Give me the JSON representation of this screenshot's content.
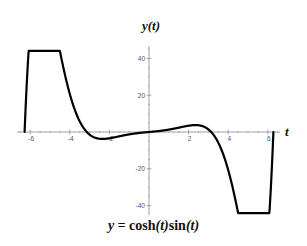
{
  "chart_data": {
    "type": "line",
    "title": "",
    "function": "y = cosh(t)sin(t)",
    "caption": "y = cosh(t)sin(t)",
    "xlabel": "t",
    "ylabel": "y(t)",
    "xlim": [
      -6.283,
      6.283
    ],
    "ylim": [
      -45,
      45
    ],
    "x_ticks": [
      -6,
      -4,
      -2,
      2,
      4,
      6
    ],
    "y_ticks": [
      -40,
      -20,
      20,
      40
    ],
    "x_tick_labels": [
      "-6",
      "-4",
      "-2",
      "2",
      "4",
      "6"
    ],
    "y_tick_labels": [
      "-40",
      "-20",
      "20",
      "40"
    ],
    "grid": false,
    "legend": null,
    "series": [
      {
        "name": "cosh(t)sin(t)",
        "x": [
          -6.283,
          -6.0,
          -5.5,
          -5.0,
          -4.5,
          -4.0,
          -3.5,
          -3.0,
          -2.5,
          -2.0,
          -1.5,
          -1.0,
          -0.5,
          0,
          0.5,
          1.0,
          1.5,
          2.0,
          2.5,
          3.0,
          3.5,
          4.0,
          4.5,
          5.0,
          5.5,
          6.0,
          6.283
        ],
        "values": [
          0,
          56.4,
          86.5,
          71.1,
          44.2,
          20.7,
          5.8,
          -1.4,
          -3.7,
          -3.4,
          -2.3,
          -1.3,
          -0.5,
          0,
          0.5,
          1.3,
          2.3,
          3.4,
          3.7,
          1.4,
          -5.8,
          -20.7,
          -44.2,
          -71.1,
          -86.5,
          -56.4,
          0
        ]
      }
    ],
    "color": "#000000"
  },
  "labels": {
    "y_axis_title": "y(t)",
    "x_axis_title": "t",
    "caption_prefix": "y = ",
    "caption_func1": "cosh",
    "caption_arg1": "(t)",
    "caption_func2": "sin",
    "caption_arg2": "(t)"
  }
}
